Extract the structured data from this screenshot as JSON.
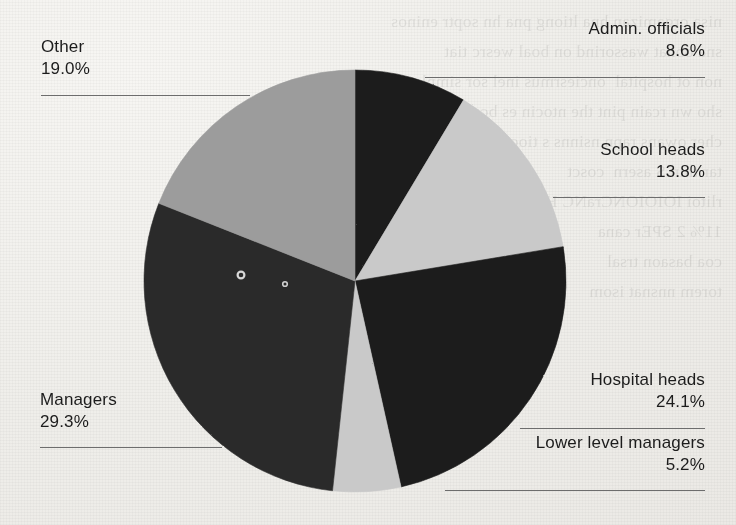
{
  "page": {
    "background_color": "#efeeea",
    "bleed_through_text": "nisa orgamizan hna ltiong pna hn soptr eninos\nsna obhat wassorind on boal wesrc tiat\nnon ot hospital  onciesrmus inel sor simple\nsho wn rcain pint the ntocin es bcar\ncher owans rapn nsinns s tiocor\ntar thin S asern  cosct\nrlitoi IOIOIONCraNC H\n11% 2 SPEr cana\ncoa basaon trsal\ntorem nnsnat isom"
  },
  "chart_data": {
    "type": "pie",
    "title": "",
    "subtitle": "",
    "xlabel": "",
    "ylabel": "",
    "legend_position": "outside-labels",
    "grid": false,
    "start_angle_deg": 0,
    "direction": "clockwise",
    "center": {
      "x": 355,
      "y": 281
    },
    "radius": 211,
    "value_unit": "%",
    "categories": [
      "Admin. officials",
      "School heads",
      "Hospital heads",
      "Lower level managers",
      "Managers",
      "Other"
    ],
    "values": [
      8.6,
      13.8,
      24.1,
      5.2,
      29.3,
      19.0
    ],
    "value_labels": [
      "8.6%",
      "13.8%",
      "24.1%",
      "5.2%",
      "29.3%",
      "19.0%"
    ],
    "colors": [
      "#1d1d1d",
      "#c9c9c9",
      "#1d1d1d",
      "#c9c9c9",
      "#2b2b2b",
      "#9c9c9c"
    ],
    "slices": [
      {
        "label": "Admin. officials",
        "value": 8.6,
        "value_label": "8.6%",
        "color": "#1d1d1d"
      },
      {
        "label": "School heads",
        "value": 13.8,
        "value_label": "13.8%",
        "color": "#c9c9c9"
      },
      {
        "label": "Hospital heads",
        "value": 24.1,
        "value_label": "24.1%",
        "color": "#1d1d1d"
      },
      {
        "label": "Lower level managers",
        "value": 5.2,
        "value_label": "5.2%",
        "color": "#c9c9c9"
      },
      {
        "label": "Managers",
        "value": 29.3,
        "value_label": "29.3%",
        "color": "#2b2b2b"
      },
      {
        "label": "Other",
        "value": 19.0,
        "value_label": "19.0%",
        "color": "#9c9c9c"
      }
    ]
  },
  "labels": {
    "admin_officials": {
      "name": "Admin. officials",
      "pct": "8.6%"
    },
    "school_heads": {
      "name": "School heads",
      "pct": "13.8%"
    },
    "hospital_heads": {
      "name": "Hospital heads",
      "pct": "24.1%"
    },
    "lower_level_managers": {
      "name": "Lower level managers",
      "pct": "5.2%"
    },
    "managers": {
      "name": "Managers",
      "pct": "29.3%"
    },
    "other": {
      "name": "Other",
      "pct": "19.0%"
    }
  }
}
